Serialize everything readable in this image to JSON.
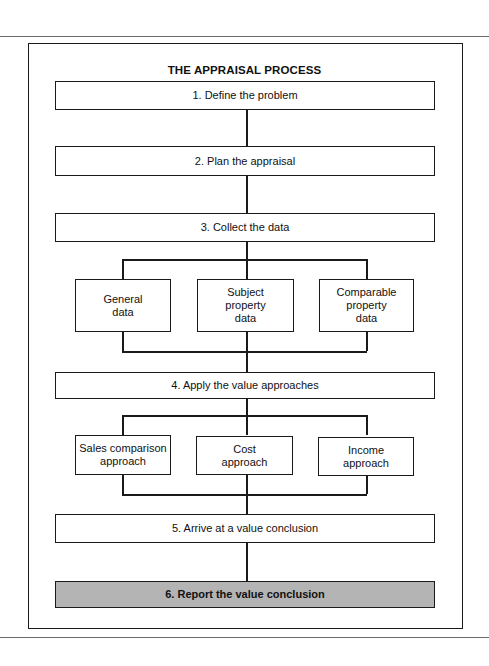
{
  "diagram": {
    "title": "THE APPRAISAL PROCESS",
    "steps": [
      {
        "number": "1.",
        "label": "1. Define the problem"
      },
      {
        "number": "2.",
        "label": "2.  Plan the appraisal"
      },
      {
        "number": "3.",
        "label": "3.  Collect the data"
      },
      {
        "number": "4.",
        "label": "4.  Apply the value approaches"
      },
      {
        "number": "5.",
        "label": "5.  Arrive at a value conclusion"
      },
      {
        "number": "6.",
        "label": "6.  Report the value conclusion",
        "highlighted": true
      }
    ],
    "data_types": [
      {
        "lines": [
          "General",
          "data"
        ]
      },
      {
        "lines": [
          "Subject",
          "property",
          "data"
        ]
      },
      {
        "lines": [
          "Comparable",
          "property",
          "data"
        ]
      }
    ],
    "approaches": [
      {
        "lines": [
          "Sales comparison",
          "approach"
        ]
      },
      {
        "lines": [
          "Cost",
          "approach"
        ]
      },
      {
        "lines": [
          "Income",
          "approach"
        ]
      }
    ],
    "colors": {
      "line": "#1a1a1a",
      "highlight_fill": "#c9c9c9",
      "background": "#ffffff"
    }
  }
}
